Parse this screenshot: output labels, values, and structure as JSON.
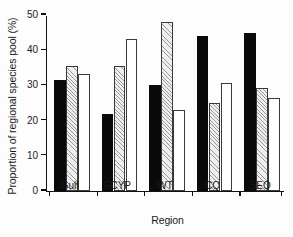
{
  "chart_data": {
    "type": "bar",
    "title": "",
    "xlabel": "Region",
    "ylabel": "Proportion of regional species pool (%)",
    "categories": [
      "Gulf",
      "ECYP",
      "WT",
      "CQ",
      "SEQ"
    ],
    "ylim": [
      0,
      50
    ],
    "yticks": [
      0,
      10,
      20,
      30,
      40,
      50
    ],
    "ytick_labels": [
      "0",
      "10",
      "20",
      "30",
      "40",
      "50"
    ],
    "grid": false,
    "legend": "none",
    "series": [
      {
        "name": "series-1",
        "style": "black",
        "color": "#0a0a0a",
        "values": [
          31.5,
          21.7,
          30.0,
          44.0,
          44.8
        ]
      },
      {
        "name": "series-2",
        "style": "hatched",
        "color": "#efefef",
        "values": [
          35.3,
          35.3,
          48.0,
          25.0,
          29.2
        ]
      },
      {
        "name": "series-3",
        "style": "white",
        "color": "#ffffff",
        "values": [
          33.0,
          43.0,
          23.0,
          30.5,
          26.4
        ]
      }
    ]
  }
}
